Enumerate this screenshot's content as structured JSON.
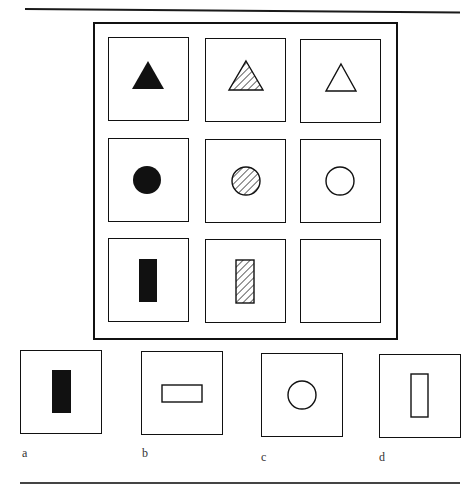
{
  "puzzle": {
    "type": "progressive-matrix",
    "matrix": {
      "rows": 3,
      "cols": 3,
      "cells": [
        {
          "row": 1,
          "col": 1,
          "shape": "triangle",
          "fill": "solid"
        },
        {
          "row": 1,
          "col": 2,
          "shape": "triangle",
          "fill": "hatched"
        },
        {
          "row": 1,
          "col": 3,
          "shape": "triangle",
          "fill": "outline"
        },
        {
          "row": 2,
          "col": 1,
          "shape": "circle",
          "fill": "solid"
        },
        {
          "row": 2,
          "col": 2,
          "shape": "circle",
          "fill": "hatched"
        },
        {
          "row": 2,
          "col": 3,
          "shape": "circle",
          "fill": "outline"
        },
        {
          "row": 3,
          "col": 1,
          "shape": "vertical-rectangle",
          "fill": "solid"
        },
        {
          "row": 3,
          "col": 2,
          "shape": "vertical-rectangle",
          "fill": "hatched"
        },
        {
          "row": 3,
          "col": 3,
          "shape": "empty",
          "fill": "none"
        }
      ]
    },
    "options": [
      {
        "label": "a",
        "shape": "vertical-rectangle",
        "fill": "solid"
      },
      {
        "label": "b",
        "shape": "horizontal-rectangle",
        "fill": "outline"
      },
      {
        "label": "c",
        "shape": "circle",
        "fill": "outline"
      },
      {
        "label": "d",
        "shape": "vertical-rectangle",
        "fill": "outline"
      }
    ]
  },
  "colors": {
    "ink": "#111111",
    "paper": "#ffffff"
  }
}
